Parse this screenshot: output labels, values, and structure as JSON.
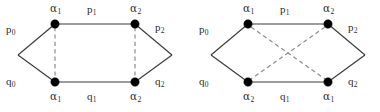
{
  "figure": {
    "type": "graph-diagram-pair",
    "background_color": "#ffffff",
    "node_color": "#000000",
    "solid_edge_color": "#3a3a3a",
    "dashed_edge_color": "#8c8c8c"
  },
  "diagrams": [
    {
      "id": "left",
      "dashed_pattern": "parallel-vertical",
      "nodes": [
        {
          "id": "tl",
          "x": 55,
          "y": 24,
          "label": "α",
          "sub": "1",
          "label_pos": "above"
        },
        {
          "id": "tr",
          "x": 135,
          "y": 24,
          "label": "α",
          "sub": "2",
          "label_pos": "above"
        },
        {
          "id": "bl",
          "x": 55,
          "y": 82,
          "label": "α",
          "sub": "1",
          "label_pos": "below"
        },
        {
          "id": "br",
          "x": 135,
          "y": 82,
          "label": "α",
          "sub": "2",
          "label_pos": "below"
        }
      ],
      "apexes": [
        {
          "id": "left-apex",
          "x": 18,
          "y": 55
        },
        {
          "id": "right-apex",
          "x": 172,
          "y": 55
        }
      ],
      "edge_labels": [
        {
          "id": "p0",
          "text": "p",
          "sub": "0",
          "x": 8,
          "y": 26
        },
        {
          "id": "p1",
          "text": "p",
          "sub": "1",
          "x": 89,
          "y": 6
        },
        {
          "id": "p2",
          "text": "p",
          "sub": "2",
          "x": 157,
          "y": 24
        },
        {
          "id": "q0",
          "text": "q",
          "sub": "0",
          "x": 8,
          "y": 78
        },
        {
          "id": "q1",
          "text": "q",
          "sub": "1",
          "x": 89,
          "y": 93
        },
        {
          "id": "q2",
          "text": "q",
          "sub": "2",
          "x": 157,
          "y": 78
        }
      ],
      "node_labels": [
        {
          "id": "tl-label",
          "text": "α",
          "sub": "1",
          "x": 50,
          "y": 5
        },
        {
          "id": "tr-label",
          "text": "α",
          "sub": "2",
          "x": 130,
          "y": 5
        },
        {
          "id": "bl-label",
          "text": "α",
          "sub": "1",
          "x": 50,
          "y": 93
        },
        {
          "id": "br-label",
          "text": "α",
          "sub": "2",
          "x": 130,
          "y": 93
        }
      ]
    },
    {
      "id": "right",
      "dashed_pattern": "crossing-x",
      "nodes": [
        {
          "id": "tl",
          "x": 58,
          "y": 24,
          "label": "α",
          "sub": "1",
          "label_pos": "above"
        },
        {
          "id": "tr",
          "x": 138,
          "y": 24,
          "label": "α",
          "sub": "2",
          "label_pos": "above"
        },
        {
          "id": "bl",
          "x": 58,
          "y": 82,
          "label": "α",
          "sub": "2",
          "label_pos": "below"
        },
        {
          "id": "br",
          "x": 138,
          "y": 82,
          "label": "α",
          "sub": "1",
          "label_pos": "below"
        }
      ],
      "apexes": [
        {
          "id": "left-apex",
          "x": 21,
          "y": 55
        },
        {
          "id": "right-apex",
          "x": 175,
          "y": 55
        }
      ],
      "edge_labels": [
        {
          "id": "p0",
          "text": "p",
          "sub": "0",
          "x": 11,
          "y": 26
        },
        {
          "id": "p1",
          "text": "p",
          "sub": "1",
          "x": 92,
          "y": 6
        },
        {
          "id": "p2",
          "text": "p",
          "sub": "2",
          "x": 160,
          "y": 24
        },
        {
          "id": "q0",
          "text": "q",
          "sub": "0",
          "x": 11,
          "y": 78
        },
        {
          "id": "q1",
          "text": "q",
          "sub": "1",
          "x": 92,
          "y": 93
        },
        {
          "id": "q2",
          "text": "q",
          "sub": "2",
          "x": 160,
          "y": 78
        }
      ],
      "node_labels": [
        {
          "id": "tl-label",
          "text": "α",
          "sub": "1",
          "x": 53,
          "y": 5
        },
        {
          "id": "tr-label",
          "text": "α",
          "sub": "2",
          "x": 133,
          "y": 5
        },
        {
          "id": "bl-label",
          "text": "α",
          "sub": "2",
          "x": 53,
          "y": 93
        },
        {
          "id": "br-label",
          "text": "α",
          "sub": "1",
          "x": 133,
          "y": 93
        }
      ]
    }
  ]
}
